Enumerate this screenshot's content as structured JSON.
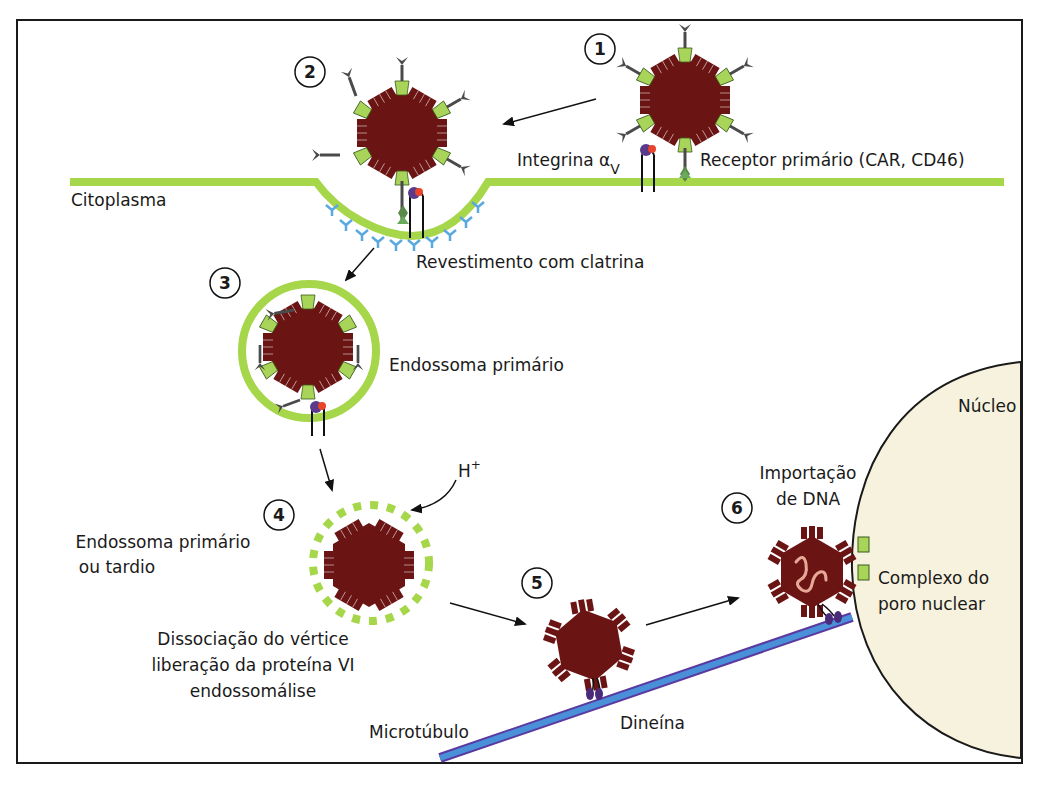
{
  "diagram": {
    "steps": [
      {
        "number": "1",
        "label": ""
      },
      {
        "number": "2",
        "label": ""
      },
      {
        "number": "3",
        "label": "Endossoma primário"
      },
      {
        "number": "4",
        "label": "Endossoma primário ou tardio"
      },
      {
        "number": "5",
        "label": ""
      },
      {
        "number": "6",
        "label": "Importação de DNA"
      }
    ],
    "labels": {
      "cytoplasm": "Citoplasma",
      "integrin": "Integrina α",
      "integrin_sub": "V",
      "primary_receptor": "Receptor primário (CAR, CD46)",
      "clathrin": "Revestimento com clatrina",
      "early_endosome": "Endossoma primário",
      "endosome_late_1": "Endossoma primário",
      "endosome_late_2": "ou tardio",
      "proton": "H",
      "proton_sup": "+",
      "dissociation_1": "Dissociação do vértice",
      "dissociation_2": "liberação da proteína VI",
      "dissociation_3": "endossomálise",
      "microtubule": "Microtúbulo",
      "dynein": "Dineína",
      "import_1": "Importação",
      "import_2": "de DNA",
      "nucleus": "Núcleo",
      "npc_1": "Complexo do",
      "npc_2": "poro nuclear"
    },
    "colors": {
      "membrane": "#a6d64a",
      "capsid": "#6b1414",
      "penton": "#a8d45a",
      "fiber": "#4a4a4a",
      "clathrin": "#5aa8e0",
      "microtubule": "#4a90d9",
      "microtubule_edge": "#5a3aa0",
      "nucleus": "#f7f2de",
      "integrin_head": "#5a3a8a",
      "integrin_dot": "#e8452a",
      "dna": "#e8a898"
    }
  }
}
